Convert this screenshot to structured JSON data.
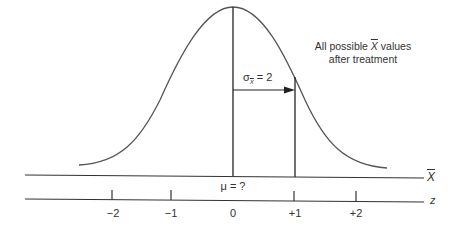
{
  "diagram": {
    "type": "normal-distribution",
    "caption": {
      "line1_prefix": "All possible ",
      "line1_symbol": "X",
      "line1_suffix": " values",
      "line2": "after treatment"
    },
    "sigma_label": {
      "symbol": "σ",
      "subscript": "X",
      "value_text": " = 2"
    },
    "mean_label": "μ = ?",
    "axes": {
      "xbar_axis_label": "X",
      "z_axis_label": "z",
      "z_ticks": [
        {
          "label": "−2",
          "x": 113
        },
        {
          "label": "−1",
          "x": 171
        },
        {
          "label": "0",
          "x": 233
        },
        {
          "label": "+1",
          "x": 295
        },
        {
          "label": "+2",
          "x": 356
        }
      ]
    },
    "colors": {
      "curve": "#555555",
      "lines": "#222222",
      "text": "#333333"
    }
  }
}
